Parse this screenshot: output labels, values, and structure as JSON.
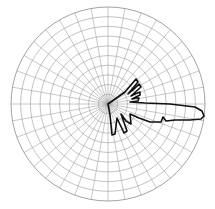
{
  "chart_data": {
    "type": "polar",
    "title": "",
    "grid": {
      "rings": 10,
      "spoke_step_deg": 10,
      "radial_range": [
        0,
        1
      ],
      "tick_labels": []
    },
    "main_lobe": {
      "direction_deg": -7,
      "relative_magnitude": 1.0
    },
    "series": [
      {
        "name": "pattern",
        "theta_deg": [
          0,
          5,
          10,
          12,
          15,
          22,
          27,
          33,
          37,
          40,
          45,
          60,
          90,
          180,
          270,
          290,
          300,
          305,
          310,
          318,
          325,
          335,
          340,
          345,
          350,
          353,
          355,
          358
        ],
        "r": [
          0.33,
          0.3,
          0.22,
          0.31,
          0.18,
          0.33,
          0.2,
          0.35,
          0.22,
          0.38,
          0.05,
          0.03,
          0.02,
          0.01,
          0.03,
          0.32,
          0.05,
          0.31,
          0.04,
          0.28,
          0.05,
          0.4,
          0.42,
          0.6,
          0.8,
          0.95,
          1.0,
          0.85
        ]
      }
    ]
  },
  "chart": {
    "center_x": 108,
    "center_y": 104,
    "radius": 97,
    "colors": {
      "grid": "#9a9a9a",
      "pattern": "#111111",
      "background": "#ffffff"
    }
  }
}
